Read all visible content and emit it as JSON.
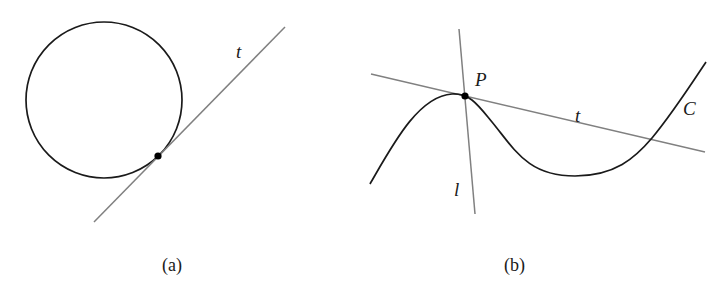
{
  "figure": {
    "panels": [
      {
        "id": "a",
        "caption": "(a)",
        "circle": {
          "cx": 104,
          "cy": 100,
          "r": 78
        },
        "tangent_point": {
          "x": 158,
          "y": 156
        },
        "tangent_line": {
          "label": "t",
          "x1": 94,
          "y1": 222,
          "x2": 285,
          "y2": 27
        }
      },
      {
        "id": "b",
        "caption": "(b)",
        "curve": {
          "label": "C"
        },
        "point": {
          "label": "P",
          "x": 465,
          "y": 96
        },
        "tangent_line": {
          "label": "t",
          "x1": 371,
          "y1": 74,
          "x2": 705,
          "y2": 152
        },
        "normal_line": {
          "label": "l",
          "x1": 459,
          "y1": 29,
          "x2": 475,
          "y2": 214
        }
      }
    ],
    "colors": {
      "curve": "#1a1a1a",
      "line": "#808080",
      "point": "#000000",
      "background": "#ffffff"
    }
  }
}
